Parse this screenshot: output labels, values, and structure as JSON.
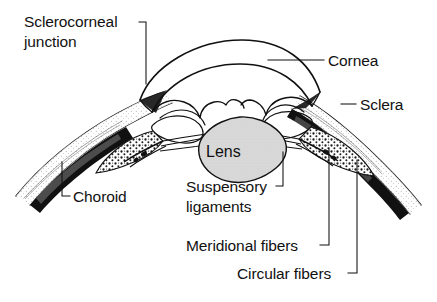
{
  "figure": {
    "background_color": "#ffffff",
    "ink_color": "#111111",
    "lens_fill_color": "#d8d8d8"
  },
  "labels": {
    "sclerocorneal_junction_line1": "Sclerocorneal",
    "sclerocorneal_junction_line2": "junction",
    "cornea": "Cornea",
    "sclera": "Sclera",
    "choroid": "Choroid",
    "lens": "Lens",
    "suspensory_line1": "Suspensory",
    "suspensory_line2": "ligaments",
    "meridional_fibers": "Meridional fibers",
    "circular_fibers": "Circular fibers"
  },
  "structures": [
    {
      "name": "cornea",
      "description": "transparent anterior dome, double-curved outline"
    },
    {
      "name": "sclera",
      "description": "stippled outer fibrous coat flanking the cornea"
    },
    {
      "name": "sclerocorneal-junction",
      "description": "limbus where cornea meets sclera"
    },
    {
      "name": "choroid",
      "description": "dark vascular layer beneath the sclera"
    },
    {
      "name": "iris",
      "description": "wavy-edged diaphragm above the lens"
    },
    {
      "name": "ciliary-body",
      "description": "stippled mass containing ciliary muscle"
    },
    {
      "name": "meridional-fibers",
      "description": "longitudinal ciliary muscle fibers"
    },
    {
      "name": "circular-fibers",
      "description": "circular ciliary muscle fibers"
    },
    {
      "name": "suspensory-ligaments",
      "description": "zonule fibers linking ciliary body to lens"
    },
    {
      "name": "lens",
      "description": "gray biconvex crystalline lens"
    }
  ]
}
